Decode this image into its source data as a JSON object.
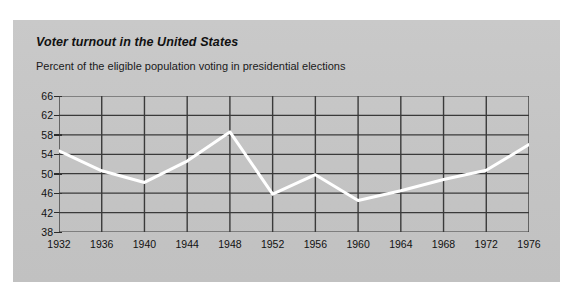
{
  "card": {
    "background_color": "#c6c6c6",
    "page_background": "#ffffff"
  },
  "chart_data": {
    "type": "line",
    "title": "Voter turnout in the United States",
    "subtitle": "Percent of the eligible population voting in presidential elections",
    "xlabel": "",
    "ylabel": "",
    "categories": [
      "1932",
      "1936",
      "1940",
      "1944",
      "1948",
      "1952",
      "1956",
      "1960",
      "1964",
      "1968",
      "1972",
      "1976"
    ],
    "x": [
      1932,
      1936,
      1940,
      1944,
      1948,
      1952,
      1956,
      1960,
      1964,
      1968,
      1972,
      1976
    ],
    "values": [
      54.7,
      50.6,
      48.2,
      52.6,
      58.6,
      45.8,
      49.8,
      44.5,
      46.5,
      48.8,
      50.7,
      56.0
    ],
    "series": [
      {
        "name": "Percent voting",
        "values": [
          54.7,
          50.6,
          48.2,
          52.6,
          58.6,
          45.8,
          49.8,
          44.5,
          46.5,
          48.8,
          50.7,
          56.0
        ],
        "color": "#ffffff"
      }
    ],
    "ylim": [
      38,
      66
    ],
    "xlim": [
      1932,
      1976
    ],
    "yticks": [
      66,
      62,
      58,
      54,
      50,
      46,
      42,
      38
    ],
    "ytick_labels": [
      "66",
      "62",
      "58",
      "54",
      "50",
      "46",
      "42",
      "38"
    ],
    "xticks": [
      1932,
      1936,
      1940,
      1944,
      1948,
      1952,
      1956,
      1960,
      1964,
      1968,
      1972,
      1976
    ],
    "xtick_labels": [
      "1932",
      "1936",
      "1940",
      "1944",
      "1948",
      "1952",
      "1956",
      "1960",
      "1964",
      "1968",
      "1972",
      "1976"
    ],
    "grid": true,
    "grid_color": "#3a3a3a",
    "legend": false,
    "legend_position": "none",
    "line_color": "#ffffff",
    "line_width": 3,
    "plot_background": "#c6c6c6"
  }
}
